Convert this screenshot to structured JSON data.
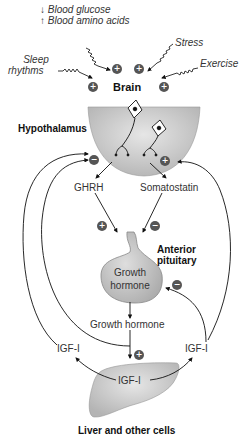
{
  "diagram": {
    "inputs": {
      "blood_glucose": {
        "label": "Blood glucose",
        "direction": "down"
      },
      "blood_amino_acids": {
        "label": "Blood amino acids",
        "direction": "up"
      },
      "sleep": {
        "label_line1": "Sleep",
        "label_line2": "rhythms"
      },
      "stress": {
        "label": "Stress"
      },
      "exercise": {
        "label": "Exercise"
      }
    },
    "nodes": {
      "brain": "Brain",
      "hypothalamus": "Hypothalamus",
      "ghrh": "GHRH",
      "somatostatin": "Somatostatin",
      "anterior_pituitary_line1": "Anterior",
      "anterior_pituitary_line2": "pituitary",
      "growth_hormone_cell_line1": "Growth",
      "growth_hormone_cell_line2": "hormone",
      "growth_hormone_release": "Growth hormone",
      "igf_left": "IGF-I",
      "igf_right": "IGF-I",
      "igf_liver": "IGF-I",
      "liver": "Liver and other cells"
    },
    "signs": {
      "plus": "+",
      "minus": "−"
    },
    "glyphs": {
      "down_arrow": "↓",
      "up_arrow": "↑"
    },
    "colors": {
      "organ_fill": "#c8c8c8",
      "sign_fill": "#555555",
      "line": "#222222"
    }
  }
}
